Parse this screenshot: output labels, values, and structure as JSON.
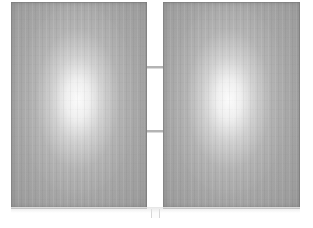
{
  "scene": {
    "title": "Two Gray Display Panels",
    "width": 313,
    "height": 228,
    "background_color": "#ffffff"
  },
  "panels": [
    {
      "name": "left-panel",
      "label": "Left Panel",
      "x": 11,
      "y": 2,
      "width": 136,
      "height": 207,
      "base_color": "#a6a6a6",
      "edge_color": "#8f8f8f",
      "hotspot": {
        "cx_pct": 49,
        "cy_pct": 47,
        "radius_pct": 62,
        "color": "#fbfbfb"
      }
    },
    {
      "name": "right-panel",
      "label": "Right Panel",
      "x": 163,
      "y": 2,
      "width": 137,
      "height": 207,
      "base_color": "#a6a6a6",
      "edge_color": "#8f8f8f",
      "hotspot": {
        "cx_pct": 48,
        "cy_pct": 47,
        "radius_pct": 62,
        "color": "#fbfbfb"
      }
    }
  ],
  "divider": {
    "name": "center-gap",
    "label": "Center Gap",
    "x": 147,
    "y": 0,
    "width": 16,
    "height": 209,
    "color": "#ffffff",
    "ticks": [
      {
        "name": "divider-tick-upper",
        "y": 66,
        "height": 2,
        "color": "#b4b4b4"
      },
      {
        "name": "divider-tick-lower",
        "y": 130,
        "height": 2,
        "color": "#b4b4b4"
      }
    ],
    "foot": {
      "x": 151,
      "y": 209,
      "width": 9,
      "height": 9,
      "color": "#fcfcfc"
    }
  },
  "floor_shadow": {
    "name": "floor-shadow",
    "x": 11,
    "y": 207,
    "width": 289,
    "height": 6,
    "color": "#e4e4e4"
  }
}
